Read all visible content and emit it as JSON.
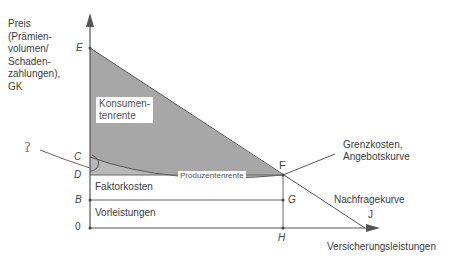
{
  "y_axis": {
    "label_lines": [
      "Preis",
      "(Prämien-",
      "volumen/",
      "Schaden-",
      "zahlungen),",
      "GK"
    ]
  },
  "x_axis": {
    "label": "Versicherungsleistungen"
  },
  "points": {
    "E": "E",
    "C": "C",
    "D": "D",
    "B": "B",
    "O": "0",
    "F": "F",
    "G": "G",
    "H": "H",
    "J": "J"
  },
  "areas": {
    "consumer_surplus": [
      "Konsumen-",
      "tenrente"
    ],
    "producer_surplus": "Produzentenrente",
    "factor_costs": "Faktorkosten",
    "intermediate_inputs": "Vorleistungen"
  },
  "curves": {
    "supply": [
      "Grenzkosten,",
      "Angebotskurve"
    ],
    "demand": "Nachfragekurve"
  },
  "annotation": {
    "handwritten_mark": "ʔ"
  },
  "colors": {
    "shade": "#9a9a9a",
    "line": "#555555",
    "background": "#ffffff"
  }
}
